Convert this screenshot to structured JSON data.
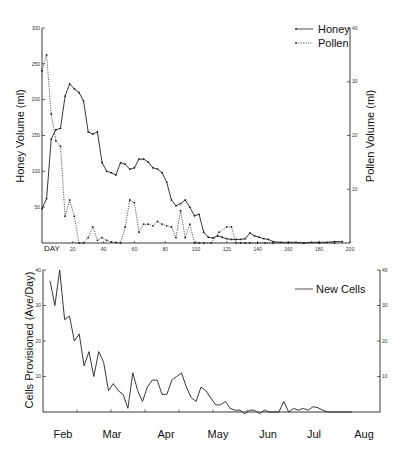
{
  "chart_data": [
    {
      "type": "line",
      "title": "",
      "xlabel": "DAY",
      "ylabel": "Honey Volume (ml)",
      "ylabel_right": "Pollen Volume (ml)",
      "xlim": [
        0,
        200
      ],
      "ylim": [
        0,
        300
      ],
      "ylim_right": [
        0,
        40
      ],
      "x_ticks": [
        20,
        40,
        60,
        80,
        100,
        120,
        140,
        160,
        180,
        200
      ],
      "y_ticks": [
        50,
        100,
        150,
        200,
        250,
        300
      ],
      "y_ticks_right": [
        10,
        20,
        30,
        40
      ],
      "grid": false,
      "legend_position": "upper right",
      "series": [
        {
          "name": "Honey",
          "style": "solid",
          "axis": "left",
          "x": [
            0,
            3,
            6,
            9,
            12,
            15,
            18,
            21,
            24,
            27,
            30,
            33,
            36,
            39,
            42,
            45,
            48,
            51,
            54,
            57,
            60,
            63,
            66,
            69,
            72,
            75,
            78,
            81,
            84,
            87,
            90,
            93,
            96,
            99,
            102,
            105,
            108,
            111,
            114,
            117,
            120,
            123,
            126,
            129,
            132,
            135,
            138,
            141,
            144,
            147,
            150,
            155,
            160,
            165,
            170,
            175,
            180,
            185,
            190,
            195
          ],
          "values": [
            48,
            62,
            145,
            158,
            160,
            205,
            222,
            215,
            210,
            198,
            155,
            152,
            155,
            112,
            100,
            98,
            95,
            112,
            110,
            103,
            105,
            117,
            117,
            113,
            105,
            103,
            98,
            85,
            60,
            52,
            55,
            60,
            50,
            38,
            40,
            15,
            8,
            7,
            10,
            8,
            6,
            5,
            5,
            5,
            6,
            14,
            10,
            8,
            6,
            5,
            2,
            1,
            1,
            1,
            0,
            1,
            1,
            1,
            2,
            2
          ]
        },
        {
          "name": "Pollen",
          "style": "dotted",
          "axis": "right",
          "x": [
            0,
            3,
            6,
            9,
            12,
            15,
            18,
            21,
            24,
            27,
            30,
            33,
            36,
            39,
            42,
            45,
            48,
            51,
            54,
            57,
            60,
            63,
            66,
            69,
            72,
            75,
            78,
            81,
            84,
            87,
            90,
            93,
            96,
            99,
            102,
            105,
            110,
            115,
            120,
            123,
            126,
            129,
            132,
            135,
            140,
            145,
            150,
            160,
            170,
            180,
            190
          ],
          "values": [
            32,
            35,
            24,
            19,
            18,
            5,
            8,
            5,
            0,
            0,
            1,
            3,
            0.5,
            1,
            0.5,
            0.2,
            0.1,
            0,
            3,
            8,
            7.5,
            2,
            3.5,
            3.5,
            3.2,
            4,
            3.5,
            3.2,
            3,
            1,
            6,
            1,
            3.5,
            0,
            0,
            0,
            0,
            2,
            3,
            3,
            0,
            0,
            0,
            0,
            0,
            0,
            0,
            0,
            0,
            0,
            0
          ]
        }
      ]
    },
    {
      "type": "line",
      "title": "",
      "xlabel": "",
      "ylabel": "Cells Provisioned (Ave/Day)",
      "ylim": [
        0,
        40
      ],
      "y_ticks": [
        10,
        20,
        30,
        40
      ],
      "y_ticks_right": [
        10,
        20,
        30,
        40
      ],
      "categories": [
        "Feb",
        "Mar",
        "Apr",
        "May",
        "Jun",
        "Jul",
        "Aug"
      ],
      "grid": false,
      "legend_position": "upper right",
      "series": [
        {
          "name": "New Cells",
          "style": "solid",
          "x": [
            0,
            1,
            2,
            3,
            4,
            5,
            6,
            7,
            8,
            9,
            10,
            11,
            12,
            13,
            14,
            15,
            16,
            17,
            18,
            19,
            20,
            21,
            22,
            23,
            24,
            25,
            26,
            27,
            28,
            29,
            30,
            31,
            32,
            33,
            34,
            35,
            36,
            37,
            38,
            39,
            40,
            41,
            42,
            43,
            44,
            45,
            46,
            47,
            48,
            49,
            50,
            51,
            52,
            53,
            54,
            55,
            56,
            57,
            58,
            59,
            60,
            61,
            62
          ],
          "values": [
            37,
            30,
            40,
            26,
            27,
            20,
            22,
            13,
            17,
            10,
            17,
            14,
            6,
            8,
            6,
            5,
            1,
            11,
            6,
            3,
            7,
            9,
            9,
            5,
            5,
            9,
            10,
            11,
            7,
            4,
            3,
            7,
            6,
            4,
            2,
            2,
            3,
            1,
            0.5,
            0.5,
            -0.5,
            0.5,
            0.5,
            -0.5,
            0.5,
            0,
            0,
            0,
            3,
            0,
            1,
            0.5,
            1,
            0.5,
            1.5,
            1.2,
            0.5,
            0,
            0,
            0,
            0,
            0,
            0
          ]
        }
      ]
    }
  ],
  "top_chart": {
    "ylabel_left": "Honey Volume (ml)",
    "ylabel_right": "Pollen Volume (ml)",
    "xlabel": "DAY",
    "legend": [
      {
        "label": "Honey",
        "style": "solid"
      },
      {
        "label": "Pollen",
        "style": "dotted"
      }
    ],
    "left_ticks": [
      "50",
      "100",
      "150",
      "200",
      "250",
      "300"
    ],
    "right_ticks": [
      "10",
      "20",
      "30",
      "40"
    ],
    "x_ticks": [
      "20",
      "40",
      "60",
      "80",
      "100",
      "120",
      "140",
      "160",
      "180",
      "200"
    ]
  },
  "bottom_chart": {
    "ylabel_left": "Cells Provisioned (Ave/Day)",
    "legend": [
      {
        "label": "New Cells",
        "style": "solid"
      }
    ],
    "left_ticks": [
      "10",
      "20",
      "30",
      "40"
    ],
    "right_ticks": [
      "10",
      "20",
      "30",
      "40"
    ],
    "months": [
      "Feb",
      "Mar",
      "Apr",
      "May",
      "Jun",
      "Jul",
      "Aug"
    ]
  }
}
